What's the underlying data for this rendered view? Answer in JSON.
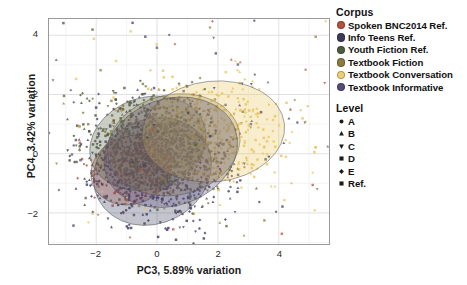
{
  "chart_data": {
    "type": "scatter",
    "title": "",
    "xlabel": "PC3, 5.89% variation",
    "ylabel": "PC4, 3.42% variation",
    "xlim": [
      -3.55,
      5.65
    ],
    "ylim": [
      -3.05,
      4.55
    ],
    "xticks": [
      -2,
      0,
      2,
      4
    ],
    "xticklabels": [
      "−2",
      "0",
      "2",
      "4"
    ],
    "yticks": [
      -2,
      0,
      2,
      4
    ],
    "yticklabels": [
      "−2",
      "0",
      "2",
      "4"
    ],
    "grid": true,
    "legend_position": "right",
    "series": [
      {
        "name": "Spoken BNC2014 Ref.",
        "color": "#b5513c",
        "n_points": 150,
        "ellipse": {
          "cx": -0.85,
          "cy": -0.55,
          "rx": 1.35,
          "ry": 1.15,
          "angle": -20
        }
      },
      {
        "name": "Info Teens Ref.",
        "color": "#3d3a5c",
        "n_points": 460,
        "ellipse": {
          "cx": -0.15,
          "cy": -0.6,
          "rx": 2.0,
          "ry": 1.75,
          "angle": -28
        }
      },
      {
        "name": "Youth Fiction Ref.",
        "color": "#4e5c3a",
        "n_points": 420,
        "ellipse": {
          "cx": -0.3,
          "cy": 0.35,
          "rx": 1.95,
          "ry": 1.55,
          "angle": -18
        }
      },
      {
        "name": "Textbook Fiction",
        "color": "#8a7c3f",
        "n_points": 330,
        "ellipse": {
          "cx": 0.55,
          "cy": 0.3,
          "rx": 2.2,
          "ry": 1.7,
          "angle": -12
        }
      },
      {
        "name": "Textbook Conversation",
        "color": "#e8c25a",
        "n_points": 340,
        "ellipse": {
          "cx": 1.85,
          "cy": 0.75,
          "rx": 2.35,
          "ry": 1.7,
          "angle": -6
        }
      },
      {
        "name": "Textbook Informative",
        "color": "#554c7a",
        "n_points": 300,
        "ellipse": {
          "cx": 0.45,
          "cy": 0.05,
          "rx": 2.25,
          "ry": 1.8,
          "angle": -20
        }
      }
    ]
  },
  "legend": {
    "corpus": {
      "title": "Corpus",
      "items": [
        {
          "label": "Spoken BNC2014 Ref.",
          "color": "#b5513c"
        },
        {
          "label": "Info Teens Ref.",
          "color": "#3d3a5c"
        },
        {
          "label": "Youth Fiction Ref.",
          "color": "#4e5c3a"
        },
        {
          "label": "Textbook Fiction",
          "color": "#8a7c3f"
        },
        {
          "label": "Textbook Conversation",
          "color": "#edcf74"
        },
        {
          "label": "Textbook Informative",
          "color": "#554c7a"
        }
      ]
    },
    "level": {
      "title": "Level",
      "items": [
        {
          "label": "A",
          "shape": "circle"
        },
        {
          "label": "B",
          "shape": "triangle-up"
        },
        {
          "label": "C",
          "shape": "triangle-down"
        },
        {
          "label": "D",
          "shape": "square"
        },
        {
          "label": "E",
          "shape": "diamond"
        },
        {
          "label": "Ref.",
          "shape": "square-small"
        }
      ]
    }
  }
}
